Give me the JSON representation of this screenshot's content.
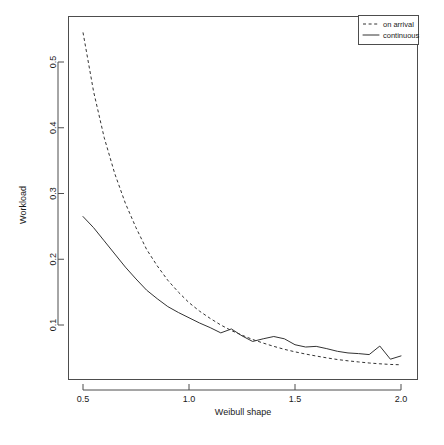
{
  "chart_data": {
    "type": "line",
    "title": "",
    "xlabel": "Weibull shape",
    "ylabel": "Workload",
    "xlim": [
      0.45,
      2.05
    ],
    "ylim": [
      0.015,
      0.565
    ],
    "grid": false,
    "legend_position": "top-right",
    "xticks": [
      "0.5",
      "1.0",
      "1.5",
      "2.0"
    ],
    "xtick_values": [
      0.5,
      1.0,
      1.5,
      2.0
    ],
    "yticks": [
      "0.1",
      "0.2",
      "0.3",
      "0.4",
      "0.5"
    ],
    "ytick_values": [
      0.1,
      0.2,
      0.3,
      0.4,
      0.5
    ],
    "series": [
      {
        "name": "on arrival",
        "style": "dashed",
        "color": "#333333",
        "x": [
          0.5,
          0.55,
          0.6,
          0.65,
          0.7,
          0.75,
          0.8,
          0.85,
          0.9,
          0.95,
          1.0,
          1.05,
          1.1,
          1.15,
          1.2,
          1.25,
          1.3,
          1.35,
          1.4,
          1.45,
          1.5,
          1.55,
          1.6,
          1.65,
          1.7,
          1.75,
          1.8,
          1.85,
          1.9,
          1.95,
          2.0
        ],
        "values": [
          0.545,
          0.455,
          0.385,
          0.33,
          0.285,
          0.248,
          0.215,
          0.19,
          0.168,
          0.15,
          0.134,
          0.121,
          0.11,
          0.1,
          0.0915,
          0.0845,
          0.078,
          0.0725,
          0.0675,
          0.063,
          0.0592,
          0.0558,
          0.0528,
          0.05,
          0.0475,
          0.0455,
          0.0438,
          0.0422,
          0.041,
          0.04,
          0.0395
        ]
      },
      {
        "name": "continuous",
        "style": "solid",
        "color": "#333333",
        "x": [
          0.5,
          0.55,
          0.6,
          0.65,
          0.7,
          0.75,
          0.8,
          0.85,
          0.9,
          0.95,
          1.0,
          1.05,
          1.1,
          1.15,
          1.2,
          1.25,
          1.3,
          1.35,
          1.4,
          1.45,
          1.5,
          1.55,
          1.6,
          1.65,
          1.7,
          1.75,
          1.8,
          1.85,
          1.9,
          1.95,
          2.0
        ],
        "values": [
          0.265,
          0.248,
          0.228,
          0.208,
          0.188,
          0.17,
          0.153,
          0.14,
          0.128,
          0.119,
          0.111,
          0.103,
          0.096,
          0.088,
          0.094,
          0.0835,
          0.075,
          0.079,
          0.0825,
          0.079,
          0.07,
          0.0665,
          0.0675,
          0.064,
          0.06,
          0.0575,
          0.0565,
          0.055,
          0.068,
          0.048,
          0.053
        ]
      }
    ],
    "legend_entries": [
      {
        "label": "on arrival",
        "style": "dashed"
      },
      {
        "label": "continuous",
        "style": "solid"
      }
    ]
  },
  "geometry": {
    "plot_left": 68,
    "plot_right": 418,
    "plot_top": 16,
    "plot_bottom": 380,
    "x_pix_at_min": 83,
    "x_pix_at_max": 401,
    "y_pix_at_01": 325,
    "y_pix_at_05": 62,
    "legend": {
      "x": 358,
      "y": 15,
      "w": 60,
      "h": 29
    }
  }
}
